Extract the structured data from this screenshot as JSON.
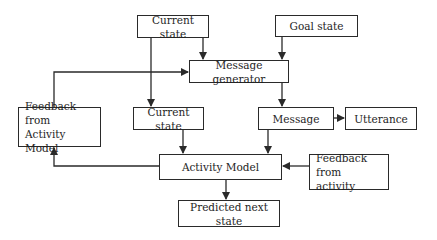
{
  "diagram": {
    "nodes": [
      {
        "id": "current_state_top",
        "label": "Current state"
      },
      {
        "id": "goal_state",
        "label": "Goal state"
      },
      {
        "id": "message_generator",
        "label": "Message generator"
      },
      {
        "id": "feedback_activity_model",
        "label": "Feedback from\nActivity Model",
        "lines": [
          "Feedback from",
          "Activity Model"
        ]
      },
      {
        "id": "current_state_mid",
        "label": "Current state"
      },
      {
        "id": "message",
        "label": "Message"
      },
      {
        "id": "utterance",
        "label": "Utterance"
      },
      {
        "id": "activity_model",
        "label": "Activity Model"
      },
      {
        "id": "feedback_activity",
        "label": "Feedback from\nactivity",
        "lines": [
          "Feedback from",
          "activity"
        ]
      },
      {
        "id": "predicted_next_state",
        "label": "Predicted next state"
      }
    ],
    "edges": [
      {
        "from": "current_state_top",
        "to": "message_generator"
      },
      {
        "from": "current_state_top",
        "to": "current_state_mid"
      },
      {
        "from": "goal_state",
        "to": "message_generator"
      },
      {
        "from": "feedback_activity_model",
        "to": "message_generator"
      },
      {
        "from": "message_generator",
        "to": "message"
      },
      {
        "from": "message",
        "to": "utterance"
      },
      {
        "from": "message",
        "to": "activity_model"
      },
      {
        "from": "current_state_mid",
        "to": "activity_model"
      },
      {
        "from": "activity_model",
        "to": "feedback_activity_model"
      },
      {
        "from": "feedback_activity",
        "to": "activity_model"
      },
      {
        "from": "activity_model",
        "to": "predicted_next_state"
      }
    ],
    "line_color": "#2a2a2a"
  }
}
